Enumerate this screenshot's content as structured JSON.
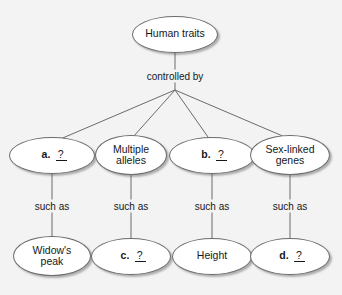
{
  "diagram": {
    "type": "concept-map",
    "background_color": "#f3f3f3",
    "node_fill_color": "#ffffff",
    "node_border_color": "#6b6b6b",
    "edge_color": "#6b6b6b",
    "text_color": "#14181c",
    "nodes": [
      {
        "id": "human-traits",
        "label": "Human traits",
        "is_blank": false,
        "x": 175,
        "y": 34,
        "w": 86,
        "h": 37,
        "font_size": 10.5
      },
      {
        "id": "a-blank",
        "label": "a.",
        "blank_mark": "?",
        "is_blank": true,
        "x": 52,
        "y": 155,
        "w": 86,
        "h": 37,
        "font_size": 10.5
      },
      {
        "id": "multiple-alleles",
        "label": "Multiple\nalleles",
        "is_blank": false,
        "x": 131,
        "y": 155,
        "w": 72,
        "h": 40,
        "font_size": 10.5
      },
      {
        "id": "b-blank",
        "label": "b.",
        "blank_mark": "?",
        "is_blank": true,
        "x": 212,
        "y": 155,
        "w": 86,
        "h": 37,
        "font_size": 10.5
      },
      {
        "id": "sex-linked-genes",
        "label": "Sex-linked\ngenes",
        "is_blank": false,
        "x": 290,
        "y": 155,
        "w": 80,
        "h": 40,
        "font_size": 10.5
      },
      {
        "id": "widows-peak",
        "label": "Widow's\npeak",
        "is_blank": false,
        "x": 52,
        "y": 256,
        "w": 78,
        "h": 40,
        "font_size": 10.5
      },
      {
        "id": "c-blank",
        "label": "c.",
        "blank_mark": "?",
        "is_blank": true,
        "x": 131,
        "y": 256,
        "w": 80,
        "h": 37,
        "font_size": 10.5
      },
      {
        "id": "height",
        "label": "Height",
        "is_blank": false,
        "x": 212,
        "y": 256,
        "w": 80,
        "h": 37,
        "font_size": 10.5
      },
      {
        "id": "d-blank",
        "label": "d.",
        "blank_mark": "?",
        "is_blank": true,
        "x": 290,
        "y": 256,
        "w": 80,
        "h": 37,
        "font_size": 10.5
      }
    ],
    "edge_labels": [
      {
        "id": "controlled-by",
        "text": "controlled by",
        "x": 175,
        "y": 76,
        "font_size": 10
      },
      {
        "id": "such-as-a",
        "text": "such as",
        "x": 52,
        "y": 206,
        "font_size": 10
      },
      {
        "id": "such-as-b",
        "text": "such as",
        "x": 131,
        "y": 206,
        "font_size": 10
      },
      {
        "id": "such-as-c",
        "text": "such as",
        "x": 212,
        "y": 206,
        "font_size": 10
      },
      {
        "id": "such-as-d",
        "text": "such as",
        "x": 290,
        "y": 206,
        "font_size": 10
      }
    ],
    "edges": [
      {
        "id": "edge-root-to-hub",
        "from": "human-traits",
        "to": "fan-hub",
        "x1": 175,
        "y1": 53,
        "x2": 175,
        "y2": 90
      },
      {
        "id": "edge-hub-to-a",
        "from": "fan-hub",
        "to": "a-blank",
        "x1": 175,
        "y1": 90,
        "x2": 58,
        "y2": 140
      },
      {
        "id": "edge-hub-to-multiple-alleles",
        "from": "fan-hub",
        "to": "multiple-alleles",
        "x1": 175,
        "y1": 90,
        "x2": 133,
        "y2": 137
      },
      {
        "id": "edge-hub-to-b",
        "from": "fan-hub",
        "to": "b-blank",
        "x1": 175,
        "y1": 90,
        "x2": 208,
        "y2": 137
      },
      {
        "id": "edge-hub-to-sex-linked",
        "from": "fan-hub",
        "to": "sex-linked-genes",
        "x1": 175,
        "y1": 90,
        "x2": 285,
        "y2": 137
      },
      {
        "id": "edge-a-to-widows-peak",
        "from": "a-blank",
        "to": "widows-peak",
        "x1": 52,
        "y1": 174,
        "x2": 52,
        "y2": 237
      },
      {
        "id": "edge-multiple-alleles-to-c",
        "from": "multiple-alleles",
        "to": "c-blank",
        "x1": 131,
        "y1": 175,
        "x2": 131,
        "y2": 238
      },
      {
        "id": "edge-b-to-height",
        "from": "b-blank",
        "to": "height",
        "x1": 212,
        "y1": 174,
        "x2": 212,
        "y2": 238
      },
      {
        "id": "edge-sex-linked-to-d",
        "from": "sex-linked-genes",
        "to": "d-blank",
        "x1": 290,
        "y1": 175,
        "x2": 290,
        "y2": 238
      }
    ]
  }
}
